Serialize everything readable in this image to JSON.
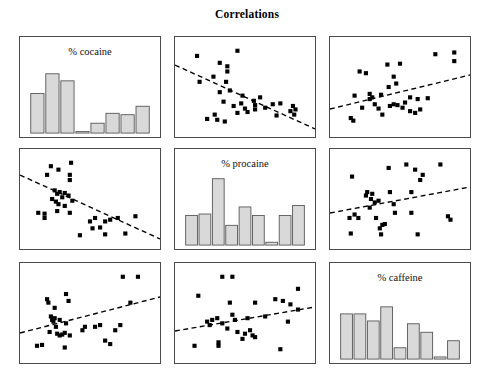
{
  "title": "Correlations",
  "variables": [
    "% cocaine",
    "% procaine",
    "% caffeine"
  ],
  "panel_labels": {
    "cocaine": "% cocaine",
    "procaine": "% procaine",
    "caffeine": "% caffeine"
  },
  "style": {
    "point_color": "#000000",
    "bar_fill": "#d9d9d9",
    "bar_stroke": "#555555",
    "trend_color": "#000000",
    "frame_color": "#4a4a4a",
    "background": "#ffffff"
  },
  "layout": {
    "rows": 3,
    "cols": 3,
    "panel_width": 142,
    "panel_height": 102,
    "col_x": [
      19,
      174,
      329
    ],
    "row_y": [
      36,
      148,
      262
    ]
  },
  "chart_data": {
    "type": "scatter",
    "title": "Correlations",
    "subtitle": "",
    "xlabel": "",
    "ylabel": "",
    "grid": false,
    "legend": "none",
    "matrix_variables": [
      "% cocaine",
      "% procaine",
      "% caffeine"
    ],
    "panels": [
      {
        "id": "r1c1",
        "row": 1,
        "col": 1,
        "kind": "histogram",
        "label": "% cocaine",
        "xvar": "% cocaine",
        "yvar": "% cocaine",
        "bins": 8,
        "bar_values": [
          56,
          84,
          74,
          2,
          14,
          28,
          26,
          26,
          38
        ],
        "bar_values_used": [
          56,
          84,
          74,
          2,
          14,
          28,
          26,
          38
        ],
        "ylim": [
          0,
          100
        ]
      },
      {
        "id": "r1c2",
        "row": 1,
        "col": 2,
        "kind": "scatter",
        "xvar": "% procaine",
        "yvar": "% cocaine",
        "trend": "negative",
        "trend_line": {
          "x1": 0.0,
          "y1": 0.72,
          "x2": 1.0,
          "y2": 0.08
        },
        "n_points": 33,
        "points": [
          [
            0.12,
            0.86
          ],
          [
            0.3,
            0.78
          ],
          [
            0.44,
            0.92
          ],
          [
            0.36,
            0.74
          ],
          [
            0.36,
            0.68
          ],
          [
            0.14,
            0.56
          ],
          [
            0.25,
            0.62
          ],
          [
            0.35,
            0.56
          ],
          [
            0.33,
            0.33
          ],
          [
            0.41,
            0.28
          ],
          [
            0.47,
            0.31
          ],
          [
            0.5,
            0.25
          ],
          [
            0.57,
            0.34
          ],
          [
            0.58,
            0.29
          ],
          [
            0.58,
            0.24
          ],
          [
            0.62,
            0.38
          ],
          [
            0.26,
            0.18
          ],
          [
            0.28,
            0.12
          ],
          [
            0.34,
            0.1
          ],
          [
            0.2,
            0.13
          ],
          [
            0.44,
            0.2
          ],
          [
            0.52,
            0.21
          ],
          [
            0.72,
            0.3
          ],
          [
            0.78,
            0.31
          ],
          [
            0.75,
            0.17
          ],
          [
            0.86,
            0.22
          ],
          [
            0.88,
            0.28
          ],
          [
            0.89,
            0.18
          ],
          [
            0.9,
            0.24
          ],
          [
            0.66,
            0.26
          ],
          [
            0.38,
            0.46
          ],
          [
            0.3,
            0.44
          ],
          [
            0.48,
            0.4
          ]
        ]
      },
      {
        "id": "r1c3",
        "row": 1,
        "col": 3,
        "kind": "scatter",
        "xvar": "% caffeine",
        "yvar": "% cocaine",
        "trend": "positive",
        "trend_line": {
          "x1": 0.0,
          "y1": 0.28,
          "x2": 1.0,
          "y2": 0.62
        },
        "n_points": 32,
        "points": [
          [
            0.78,
            0.88
          ],
          [
            0.93,
            0.9
          ],
          [
            0.93,
            0.8
          ],
          [
            0.4,
            0.76
          ],
          [
            0.5,
            0.77
          ],
          [
            0.18,
            0.68
          ],
          [
            0.23,
            0.66
          ],
          [
            0.45,
            0.62
          ],
          [
            0.47,
            0.54
          ],
          [
            0.41,
            0.5
          ],
          [
            0.14,
            0.4
          ],
          [
            0.26,
            0.42
          ],
          [
            0.26,
            0.36
          ],
          [
            0.28,
            0.38
          ],
          [
            0.35,
            0.41
          ],
          [
            0.58,
            0.38
          ],
          [
            0.64,
            0.36
          ],
          [
            0.72,
            0.37
          ],
          [
            0.54,
            0.32
          ],
          [
            0.42,
            0.28
          ],
          [
            0.45,
            0.3
          ],
          [
            0.48,
            0.29
          ],
          [
            0.2,
            0.26
          ],
          [
            0.33,
            0.25
          ],
          [
            0.58,
            0.22
          ],
          [
            0.62,
            0.2
          ],
          [
            0.66,
            0.24
          ],
          [
            0.11,
            0.14
          ],
          [
            0.13,
            0.11
          ],
          [
            0.36,
            0.18
          ],
          [
            0.52,
            0.26
          ],
          [
            0.3,
            0.3
          ]
        ]
      },
      {
        "id": "r2c1",
        "row": 2,
        "col": 1,
        "kind": "scatter",
        "xvar": "% cocaine",
        "yvar": "% procaine",
        "trend": "negative",
        "trend_line": {
          "x1": 0.0,
          "y1": 0.74,
          "x2": 1.0,
          "y2": 0.1
        },
        "n_points": 33,
        "points": [
          [
            0.19,
            0.88
          ],
          [
            0.25,
            0.84
          ],
          [
            0.16,
            0.78
          ],
          [
            0.35,
            0.92
          ],
          [
            0.34,
            0.78
          ],
          [
            0.34,
            0.72
          ],
          [
            0.22,
            0.6
          ],
          [
            0.24,
            0.56
          ],
          [
            0.26,
            0.58
          ],
          [
            0.3,
            0.57
          ],
          [
            0.28,
            0.52
          ],
          [
            0.2,
            0.5
          ],
          [
            0.23,
            0.47
          ],
          [
            0.25,
            0.44
          ],
          [
            0.33,
            0.54
          ],
          [
            0.36,
            0.48
          ],
          [
            0.09,
            0.34
          ],
          [
            0.14,
            0.33
          ],
          [
            0.14,
            0.28
          ],
          [
            0.24,
            0.36
          ],
          [
            0.34,
            0.34
          ],
          [
            0.5,
            0.24
          ],
          [
            0.54,
            0.28
          ],
          [
            0.62,
            0.24
          ],
          [
            0.66,
            0.26
          ],
          [
            0.72,
            0.28
          ],
          [
            0.86,
            0.3
          ],
          [
            0.52,
            0.16
          ],
          [
            0.58,
            0.17
          ],
          [
            0.42,
            0.08
          ],
          [
            0.62,
            0.09
          ],
          [
            0.78,
            0.1
          ],
          [
            0.3,
            0.42
          ]
        ]
      },
      {
        "id": "r2c2",
        "row": 2,
        "col": 2,
        "kind": "histogram",
        "label": "% procaine",
        "xvar": "% procaine",
        "yvar": "% procaine",
        "bins": 9,
        "bar_values": [
          42,
          44,
          94,
          28,
          54,
          42,
          4,
          42,
          56
        ],
        "ylim": [
          0,
          100
        ]
      },
      {
        "id": "r2c3",
        "row": 2,
        "col": 3,
        "kind": "scatter",
        "xvar": "% caffeine",
        "yvar": "% procaine",
        "trend": "positive",
        "trend_line": {
          "x1": 0.0,
          "y1": 0.36,
          "x2": 1.0,
          "y2": 0.62
        },
        "n_points": 31,
        "points": [
          [
            0.55,
            0.9
          ],
          [
            0.82,
            0.9
          ],
          [
            0.41,
            0.86
          ],
          [
            0.62,
            0.84
          ],
          [
            0.68,
            0.78
          ],
          [
            0.66,
            0.72
          ],
          [
            0.12,
            0.76
          ],
          [
            0.24,
            0.58
          ],
          [
            0.23,
            0.54
          ],
          [
            0.28,
            0.56
          ],
          [
            0.27,
            0.5
          ],
          [
            0.3,
            0.46
          ],
          [
            0.33,
            0.48
          ],
          [
            0.42,
            0.58
          ],
          [
            0.59,
            0.58
          ],
          [
            0.45,
            0.44
          ],
          [
            0.46,
            0.34
          ],
          [
            0.59,
            0.34
          ],
          [
            0.14,
            0.32
          ],
          [
            0.1,
            0.28
          ],
          [
            0.17,
            0.28
          ],
          [
            0.31,
            0.28
          ],
          [
            0.36,
            0.2
          ],
          [
            0.38,
            0.21
          ],
          [
            0.34,
            0.16
          ],
          [
            0.88,
            0.3
          ],
          [
            0.9,
            0.26
          ],
          [
            0.11,
            0.1
          ],
          [
            0.35,
            0.09
          ],
          [
            0.64,
            0.09
          ],
          [
            0.26,
            0.4
          ]
        ]
      },
      {
        "id": "r3c1",
        "row": 3,
        "col": 1,
        "kind": "scatter",
        "xvar": "% cocaine",
        "yvar": "% caffeine",
        "trend": "positive",
        "trend_line": {
          "x1": 0.0,
          "y1": 0.3,
          "x2": 1.0,
          "y2": 0.66
        },
        "n_points": 32,
        "points": [
          [
            0.76,
            0.92
          ],
          [
            0.88,
            0.92
          ],
          [
            0.31,
            0.72
          ],
          [
            0.16,
            0.66
          ],
          [
            0.33,
            0.64
          ],
          [
            0.17,
            0.62
          ],
          [
            0.82,
            0.62
          ],
          [
            0.22,
            0.56
          ],
          [
            0.19,
            0.46
          ],
          [
            0.2,
            0.42
          ],
          [
            0.21,
            0.4
          ],
          [
            0.26,
            0.42
          ],
          [
            0.31,
            0.38
          ],
          [
            0.46,
            0.34
          ],
          [
            0.54,
            0.34
          ],
          [
            0.58,
            0.36
          ],
          [
            0.74,
            0.36
          ],
          [
            0.7,
            0.3
          ],
          [
            0.18,
            0.28
          ],
          [
            0.24,
            0.26
          ],
          [
            0.26,
            0.24
          ],
          [
            0.28,
            0.25
          ],
          [
            0.3,
            0.27
          ],
          [
            0.34,
            0.24
          ],
          [
            0.62,
            0.18
          ],
          [
            0.66,
            0.14
          ],
          [
            0.08,
            0.12
          ],
          [
            0.12,
            0.13
          ],
          [
            0.3,
            0.1
          ],
          [
            0.22,
            0.44
          ],
          [
            0.23,
            0.34
          ],
          [
            0.44,
            0.3
          ]
        ]
      },
      {
        "id": "r3c2",
        "row": 3,
        "col": 2,
        "kind": "scatter",
        "xvar": "% procaine",
        "yvar": "% caffeine",
        "trend": "positive",
        "trend_line": {
          "x1": 0.0,
          "y1": 0.32,
          "x2": 1.0,
          "y2": 0.56
        },
        "n_points": 31,
        "points": [
          [
            0.32,
            0.92
          ],
          [
            0.4,
            0.92
          ],
          [
            0.92,
            0.78
          ],
          [
            0.13,
            0.7
          ],
          [
            0.38,
            0.62
          ],
          [
            0.58,
            0.62
          ],
          [
            0.74,
            0.66
          ],
          [
            0.8,
            0.64
          ],
          [
            0.86,
            0.6
          ],
          [
            0.92,
            0.54
          ],
          [
            0.4,
            0.48
          ],
          [
            0.52,
            0.44
          ],
          [
            0.2,
            0.4
          ],
          [
            0.24,
            0.42
          ],
          [
            0.28,
            0.44
          ],
          [
            0.32,
            0.38
          ],
          [
            0.42,
            0.42
          ],
          [
            0.84,
            0.4
          ],
          [
            0.36,
            0.32
          ],
          [
            0.44,
            0.28
          ],
          [
            0.5,
            0.26
          ],
          [
            0.54,
            0.3
          ],
          [
            0.56,
            0.24
          ],
          [
            0.58,
            0.22
          ],
          [
            0.29,
            0.16
          ],
          [
            0.29,
            0.12
          ],
          [
            0.1,
            0.12
          ],
          [
            0.78,
            0.08
          ],
          [
            0.48,
            0.2
          ],
          [
            0.66,
            0.46
          ],
          [
            0.22,
            0.36
          ]
        ]
      },
      {
        "id": "r3c3",
        "row": 3,
        "col": 3,
        "kind": "histogram",
        "label": "% caffeine",
        "xvar": "% caffeine",
        "yvar": "% caffeine",
        "bins": 9,
        "bar_values": [
          64,
          64,
          54,
          74,
          16,
          50,
          38,
          3,
          26
        ],
        "ylim": [
          0,
          100
        ]
      }
    ]
  }
}
